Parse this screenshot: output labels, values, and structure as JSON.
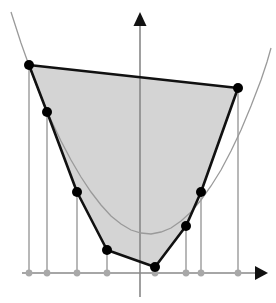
{
  "figure": {
    "title": "",
    "background_color": "#ffffff",
    "width": 276,
    "height": 303
  },
  "chart_data": {
    "type": "scatter",
    "title": "",
    "subtitle": "",
    "xlabel": "",
    "ylabel": "",
    "grid": false,
    "legend": null,
    "axes": {
      "x_axis": {
        "y_px": 273,
        "x_start_px": 22,
        "x_end_px": 268,
        "arrow": "right",
        "color": "#888888"
      },
      "y_axis": {
        "x_px": 140,
        "y_start_px": 12,
        "y_end_px": 297,
        "arrow": "up",
        "color": "#888888"
      },
      "origin_px": [
        140,
        273
      ]
    },
    "curve": {
      "name": "parabola",
      "color": "#9a9a9a",
      "points_px": [
        [
          11,
          12
        ],
        [
          21,
          43
        ],
        [
          31,
          71
        ],
        [
          41,
          97
        ],
        [
          51,
          120
        ],
        [
          61,
          141
        ],
        [
          71,
          160
        ],
        [
          81,
          177
        ],
        [
          91,
          192
        ],
        [
          101,
          205
        ],
        [
          111,
          216
        ],
        [
          121,
          224
        ],
        [
          131,
          230
        ],
        [
          141,
          233
        ],
        [
          151,
          234
        ],
        [
          161,
          232
        ],
        [
          171,
          228
        ],
        [
          181,
          221
        ],
        [
          191,
          212
        ],
        [
          201,
          200
        ],
        [
          211,
          186
        ],
        [
          221,
          170
        ],
        [
          231,
          151
        ],
        [
          241,
          130
        ],
        [
          251,
          106
        ],
        [
          261,
          80
        ],
        [
          267,
          62
        ],
        [
          271,
          48
        ]
      ]
    },
    "hull": {
      "fill_color": "#d4d4d4",
      "edge_color": "#111111",
      "vertices_px": [
        [
          29,
          65
        ],
        [
          47,
          112
        ],
        [
          77,
          192
        ],
        [
          107,
          250
        ],
        [
          155,
          267
        ],
        [
          186,
          226
        ],
        [
          201,
          192
        ],
        [
          238,
          88
        ]
      ]
    },
    "sample_points": {
      "dot_color": "#000000",
      "count": 8,
      "points_px": [
        [
          29,
          65
        ],
        [
          47,
          112
        ],
        [
          77,
          192
        ],
        [
          107,
          250
        ],
        [
          155,
          267
        ],
        [
          186,
          226
        ],
        [
          201,
          192
        ],
        [
          238,
          88
        ]
      ]
    },
    "axis_dots": {
      "dot_color": "#a8a8a8",
      "count": 8,
      "x_px": [
        29,
        47,
        77,
        107,
        155,
        186,
        201,
        238
      ]
    },
    "drop_lines": {
      "color": "#9a9a9a",
      "count": 8,
      "from_to_px": [
        [
          29,
          65,
          29,
          273
        ],
        [
          47,
          112,
          47,
          273
        ],
        [
          77,
          192,
          77,
          273
        ],
        [
          107,
          250,
          107,
          273
        ],
        [
          155,
          267,
          155,
          273
        ],
        [
          186,
          226,
          186,
          273
        ],
        [
          201,
          192,
          201,
          273
        ],
        [
          238,
          88,
          238,
          273
        ]
      ]
    }
  }
}
